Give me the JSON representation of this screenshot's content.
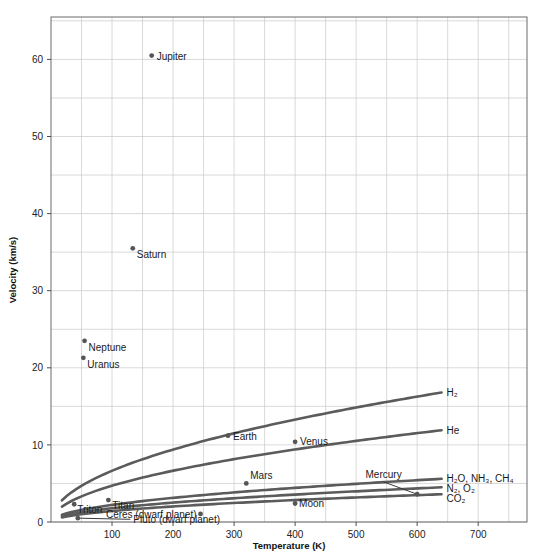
{
  "chart_data": {
    "type": "scatter",
    "title": "",
    "xlabel": "Temperature (K)",
    "ylabel": "Velocity (km/s)",
    "xlim": [
      0,
      780
    ],
    "ylim": [
      0,
      65.5
    ],
    "xticks": [
      100,
      200,
      300,
      400,
      500,
      600,
      700
    ],
    "yticks": [
      0,
      10,
      20,
      30,
      40,
      50,
      60
    ],
    "grid": true,
    "grid_minor_step_y": 5,
    "grid_minor_step_x": 50,
    "legend": "inline-labels",
    "points": [
      {
        "name": "Jupiter",
        "x": 165,
        "y": 60.5,
        "label_dx": 5,
        "label_dy": 4,
        "anchor": "start"
      },
      {
        "name": "Saturn",
        "x": 134,
        "y": 35.5,
        "label_dx": 4,
        "label_dy": 10,
        "anchor": "start"
      },
      {
        "name": "Neptune",
        "x": 55,
        "y": 23.5,
        "label_dx": 4,
        "label_dy": 10,
        "anchor": "start"
      },
      {
        "name": "Uranus",
        "x": 53,
        "y": 21.3,
        "label_dx": 4,
        "label_dy": 10,
        "anchor": "start"
      },
      {
        "name": "Earth",
        "x": 290,
        "y": 11.2,
        "label_dx": 5,
        "label_dy": 4,
        "anchor": "start"
      },
      {
        "name": "Venus",
        "x": 400,
        "y": 10.4,
        "label_dx": 5,
        "label_dy": 3,
        "anchor": "start"
      },
      {
        "name": "Mars",
        "x": 320,
        "y": 5.0,
        "label_dx": 4,
        "label_dy": -4,
        "anchor": "start"
      },
      {
        "name": "Titan",
        "x": 94,
        "y": 2.85,
        "label_dx": 4,
        "label_dy": 9,
        "anchor": "start"
      },
      {
        "name": "Triton",
        "x": 38,
        "y": 2.3,
        "label_dx": 3,
        "label_dy": 9,
        "anchor": "start"
      },
      {
        "name": "Moon",
        "x": 400,
        "y": 2.4,
        "label_dx": 4,
        "label_dy": 4,
        "anchor": "start"
      },
      {
        "name": "Ceres (dwarf planet)",
        "x": 245,
        "y": 1.05,
        "label_dx": -4,
        "label_dy": 4,
        "anchor": "end"
      },
      {
        "name": "Pluto (dwarf planet)",
        "x": 44,
        "y": 0.5,
        "label_dx": 0,
        "label_dy": 0,
        "anchor": "start",
        "leader": {
          "x1": 44,
          "y1": 0.5,
          "x2": 130,
          "y2": 0.35
        }
      },
      {
        "name": "Mercury",
        "x": 600,
        "y": 3.6,
        "label_dx": 0,
        "label_dy": 0,
        "anchor": "middle",
        "leader": {
          "x1": 600,
          "y1": 3.6,
          "x2": 545,
          "y2": 5.2
        }
      }
    ],
    "curves": [
      {
        "name": "H2",
        "label": "H",
        "sub": "2",
        "label_extra": "",
        "start_x": 18,
        "end_x": 640,
        "k": 0.663,
        "end_y": 16.8
      },
      {
        "name": "He",
        "label": "He",
        "sub": "",
        "label_extra": "",
        "start_x": 18,
        "end_x": 640,
        "k": 0.47,
        "end_y": 11.9
      },
      {
        "name": "H2O, NH3, CH4",
        "label": "H",
        "sub": "2",
        "label_extra": "O, NH3, CH4",
        "start_x": 18,
        "end_x": 640,
        "k": 0.222,
        "end_y": 5.6
      },
      {
        "name": "N2, O2",
        "label": "N",
        "sub": "2",
        "label_extra": ", O2",
        "start_x": 18,
        "end_x": 640,
        "k": 0.177,
        "end_y": 4.5
      },
      {
        "name": "CO2",
        "label": "CO",
        "sub": "2",
        "label_extra": "",
        "start_x": 18,
        "end_x": 640,
        "k": 0.142,
        "end_y": 3.6
      }
    ],
    "gas_labels": [
      {
        "id": "h2",
        "text": "H₂",
        "x": 648,
        "y": 16.8
      },
      {
        "id": "he",
        "text": "He",
        "x": 648,
        "y": 11.9
      },
      {
        "id": "h2o",
        "text": "H₂O, NH₃, CH₄",
        "x": 648,
        "y": 5.7
      },
      {
        "id": "n2o2",
        "text": "N₂, O₂",
        "x": 648,
        "y": 4.3
      },
      {
        "id": "co2",
        "text": "CO₂",
        "x": 648,
        "y": 3.0
      }
    ],
    "colors": {
      "background": "#ffffff",
      "grid": "#c9c9c9",
      "axis": "#4d4d4d",
      "curve": "#5b5b5b",
      "point": "#555555",
      "text": "#1a1a1a"
    }
  }
}
